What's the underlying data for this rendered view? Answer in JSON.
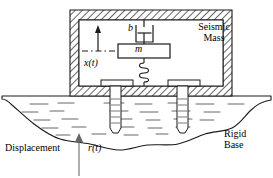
{
  "figure": {
    "type": "engineering-diagram",
    "background_color": "#ffffff",
    "line_color": "#1a1a1a",
    "hatch_color": "#4d4d4d",
    "fill_color": "#fdfdfd"
  },
  "labels": {
    "seismic_mass_line1": "Seismic",
    "seismic_mass_line2": "Mass",
    "rigid_base_line1": "Rigid",
    "rigid_base_line2": "Base",
    "displacement": "Displacement",
    "input_displacement": "r(t)",
    "output_displacement": "x(t)",
    "damper": "b",
    "mass": "m"
  },
  "components": [
    {
      "name": "seismic-mass-enclosure",
      "description": "Hatched rigid housing enclosing the seismic mass",
      "label": "Seismic Mass"
    },
    {
      "name": "damper",
      "description": "Viscous damper connecting mass to housing ceiling",
      "label": "b"
    },
    {
      "name": "mass-block",
      "description": "Rectangular proof mass block",
      "label": "m"
    },
    {
      "name": "spring",
      "description": "Coil spring connecting mass to housing floor",
      "coils": 4
    },
    {
      "name": "anchor-bolt-left",
      "description": "Threaded anchor bolt fixing housing to ground"
    },
    {
      "name": "anchor-bolt-right",
      "description": "Threaded anchor bolt fixing housing to ground"
    },
    {
      "name": "ground-base",
      "description": "Irregular rigid ground / base with soil hatch marks",
      "label": "Rigid Base"
    }
  ],
  "annotations": [
    {
      "name": "output-displacement-arrow",
      "label": "x(t)",
      "direction": "up",
      "description": "Relative displacement of mass with dash-dot datum line"
    },
    {
      "name": "input-displacement-arrow",
      "label": "r(t)",
      "direction": "up",
      "description": "Base input displacement applied to rigid base"
    }
  ]
}
